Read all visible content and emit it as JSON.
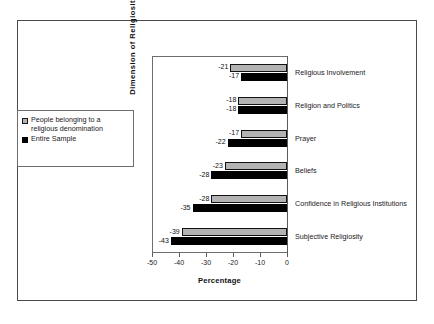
{
  "chart_data": {
    "type": "bar",
    "orientation": "horizontal",
    "title": "",
    "xlabel": "Percentage",
    "ylabel": "Dimension of Religiosity",
    "xlim": [
      -50,
      0
    ],
    "xticks": [
      -50,
      -40,
      -30,
      -20,
      -10,
      0
    ],
    "xtick_labels": [
      "-50",
      "-40",
      "-30",
      "-20",
      "-10",
      "0"
    ],
    "grid": false,
    "legend_position": "left-outside",
    "categories": [
      "Religious Involvement",
      "Religion and Politics",
      "Prayer",
      "Beliefs",
      "Confidence in Religious Institutions",
      "Subjective Religiosity"
    ],
    "series": [
      {
        "name": "People belonging to a religious denomination",
        "color": "#b3b3b3",
        "values": [
          -21,
          -18,
          -17,
          -23,
          -28,
          -39
        ],
        "labels": [
          "-21",
          "-18",
          "-17",
          "-23",
          "-28",
          "-39"
        ]
      },
      {
        "name": "Entire Sample",
        "color": "#000000",
        "values": [
          -17,
          -18,
          -22,
          -28,
          -35,
          -43
        ],
        "labels": [
          "-17",
          "-18",
          "-22",
          "-28",
          "-35",
          "-43"
        ]
      }
    ]
  },
  "legend": {
    "entries": [
      {
        "label": "People belonging to a religious denomination",
        "key": "gray-square-key"
      },
      {
        "label": "Entire Sample",
        "key": "black-square-key"
      }
    ]
  },
  "colors": {
    "series_gray": "#b3b3b3",
    "series_black": "#000000",
    "frame_border": "#4a4a4a",
    "axis_line": "#5a5a5a",
    "background": "#ffffff",
    "text": "#1a1a1a"
  }
}
